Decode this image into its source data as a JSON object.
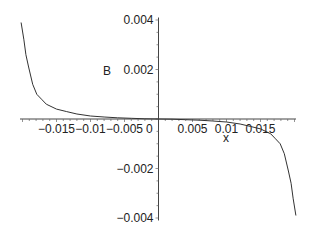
{
  "chart_data": {
    "type": "line",
    "title": "",
    "xlabel": "x",
    "ylabel": "B",
    "xlim": [
      -0.0205,
      0.0205
    ],
    "ylim": [
      -0.004,
      0.004
    ],
    "grid": false,
    "legend": null,
    "x_ticks": [
      {
        "value": -0.015,
        "label": "−0.015"
      },
      {
        "value": -0.01,
        "label": "−0.01"
      },
      {
        "value": -0.005,
        "label": "−0.005"
      },
      {
        "value": 0.005,
        "label": "0.005"
      },
      {
        "value": 0.01,
        "label": "0.01"
      },
      {
        "value": 0.015,
        "label": "0.015"
      }
    ],
    "origin_label": "0",
    "y_ticks": [
      {
        "value": 0.004,
        "label": "0.004"
      },
      {
        "value": 0.002,
        "label": "0.002"
      },
      {
        "value": -0.002,
        "label": "−0.002"
      },
      {
        "value": -0.004,
        "label": "−0.004"
      }
    ],
    "series": [
      {
        "name": "B",
        "color": "#333333",
        "x": [
          -0.0202,
          -0.0198,
          -0.0195,
          -0.0191,
          -0.0185,
          -0.0179,
          -0.0172,
          -0.0165,
          -0.015,
          -0.0135,
          -0.012,
          -0.01,
          -0.008,
          -0.006,
          -0.004,
          -0.002,
          0,
          0.002,
          0.004,
          0.006,
          0.008,
          0.01,
          0.012,
          0.0135,
          0.015,
          0.0165,
          0.0172,
          0.0179,
          0.0185,
          0.0191,
          0.0195,
          0.0198,
          0.0202
        ],
        "y": [
          0.0039,
          0.0032,
          0.0026,
          0.0021,
          0.0014,
          0.001,
          0.0008,
          0.0006,
          0.0004,
          0.0003,
          0.0002,
          0.00012,
          8e-05,
          5e-05,
          3e-05,
          1e-05,
          0,
          -1e-05,
          -3e-05,
          -5e-05,
          -8e-05,
          -0.00012,
          -0.0002,
          -0.0003,
          -0.0004,
          -0.0006,
          -0.0008,
          -0.001,
          -0.0014,
          -0.0021,
          -0.0026,
          -0.0032,
          -0.0039
        ]
      }
    ]
  }
}
